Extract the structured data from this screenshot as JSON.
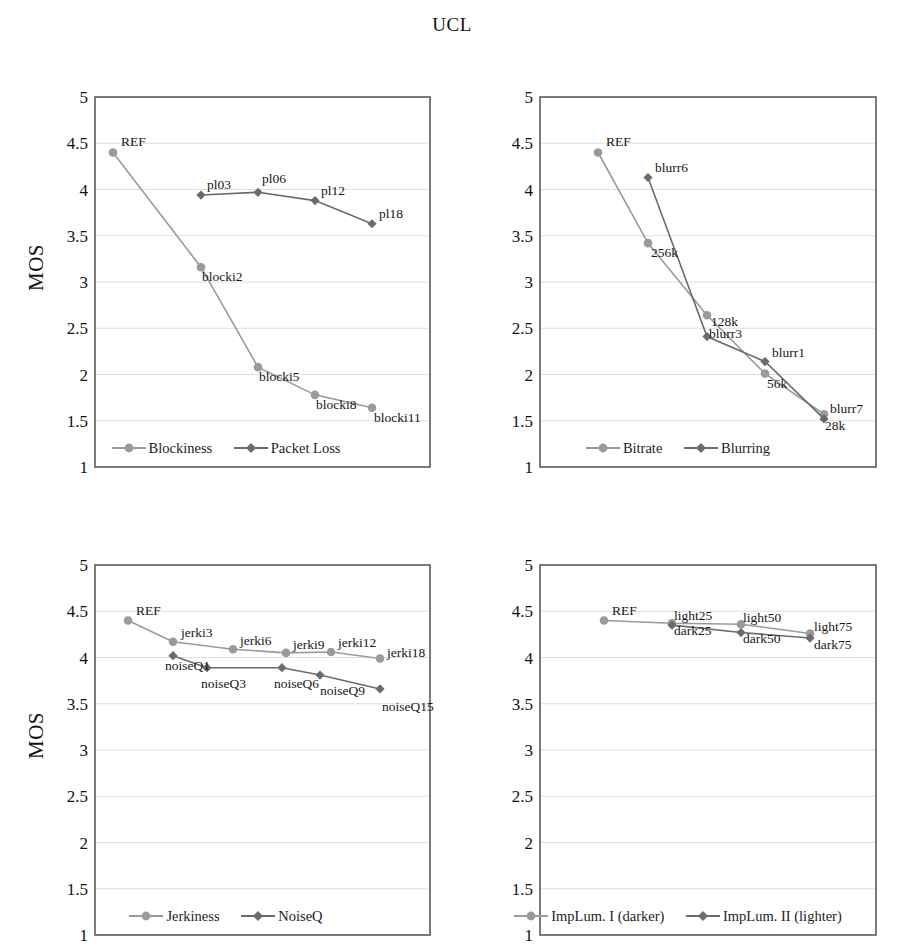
{
  "figure": {
    "title": "UCL",
    "y_axis_label": "MOS"
  },
  "style": {
    "series1_color": "#9a9a9a",
    "series2_color": "#6b6b6b",
    "plot_border_color": "#5a5a5a",
    "gridline_color": "#dedede",
    "text_color": "#171717"
  },
  "chart_data": [
    {
      "type": "line",
      "panel": "top-left",
      "title": "",
      "xlabel": "",
      "ylabel": "MOS",
      "ylim": [
        1,
        5
      ],
      "yticks": [
        "1",
        "1.5",
        "2",
        "2.5",
        "3",
        "3.5",
        "4",
        "4.5",
        "5"
      ],
      "grid": true,
      "legend_position": "bottom",
      "x": [
        0,
        1,
        2,
        3,
        4,
        5
      ],
      "series": [
        {
          "name": "Blockiness",
          "marker": "circle",
          "color": "#9a9a9a",
          "values": [
            4.4,
            3.16,
            2.08,
            1.78,
            1.64,
            null
          ],
          "point_labels": [
            "REF",
            "blocki2",
            "blocki5",
            "blocki8",
            "blocki11",
            ""
          ]
        },
        {
          "name": "Packet Loss",
          "marker": "diamond",
          "color": "#6b6b6b",
          "values": [
            4.4,
            3.94,
            3.97,
            3.88,
            3.63,
            null
          ],
          "point_labels": [
            "REF",
            "pl03",
            "pl06",
            "pl12",
            "pl18",
            ""
          ]
        }
      ]
    },
    {
      "type": "line",
      "panel": "top-right",
      "title": "",
      "xlabel": "",
      "ylabel": "MOS",
      "ylim": [
        1,
        5
      ],
      "yticks": [
        "1",
        "1.5",
        "2",
        "2.5",
        "3",
        "3.5",
        "4",
        "4.5",
        "5"
      ],
      "grid": true,
      "legend_position": "bottom",
      "x": [
        0,
        1,
        2,
        3,
        4
      ],
      "series": [
        {
          "name": "Bitrate",
          "marker": "circle",
          "color": "#9a9a9a",
          "values": [
            4.4,
            3.42,
            2.64,
            2.01,
            1.57
          ],
          "point_labels": [
            "REF",
            "256k",
            "128k",
            "56k",
            "28k"
          ]
        },
        {
          "name": "Blurring",
          "marker": "diamond",
          "color": "#6b6b6b",
          "values": [
            4.4,
            4.13,
            2.41,
            2.14,
            1.52
          ],
          "point_labels": [
            "REF",
            "blurr6",
            "blurr3",
            "blurr1",
            "blurr7"
          ]
        }
      ]
    },
    {
      "type": "line",
      "panel": "bottom-left",
      "title": "",
      "xlabel": "",
      "ylabel": "MOS",
      "ylim": [
        1,
        5
      ],
      "yticks": [
        "1",
        "1.5",
        "2",
        "2.5",
        "3",
        "3.5",
        "4",
        "4.5",
        "5"
      ],
      "grid": true,
      "legend_position": "bottom",
      "x": [
        0,
        1,
        2,
        3,
        4,
        5,
        6
      ],
      "series": [
        {
          "name": "Jerkiness",
          "marker": "circle",
          "color": "#9a9a9a",
          "values": [
            4.4,
            4.17,
            4.09,
            4.05,
            4.06,
            3.99,
            null
          ],
          "point_labels": [
            "REF",
            "jerki3",
            "jerki6",
            "jerki9",
            "jerki12",
            "jerki18",
            ""
          ]
        },
        {
          "name": "NoiseQ",
          "marker": "diamond",
          "color": "#6b6b6b",
          "values": [
            4.4,
            4.02,
            3.89,
            3.89,
            3.81,
            3.72,
            3.66
          ],
          "point_labels": [
            "REF",
            "noiseQ1",
            "noiseQ3",
            "noiseQ6",
            "noiseQ9",
            "noiseQ15",
            ""
          ]
        }
      ]
    },
    {
      "type": "line",
      "panel": "bottom-right",
      "title": "",
      "xlabel": "",
      "ylabel": "MOS",
      "ylim": [
        1,
        5
      ],
      "yticks": [
        "1",
        "1.5",
        "2",
        "2.5",
        "3",
        "3.5",
        "4",
        "4.5",
        "5"
      ],
      "grid": true,
      "legend_position": "bottom",
      "x": [
        0,
        1,
        2,
        3
      ],
      "series": [
        {
          "name": "ImpLum. I (darker)",
          "marker": "circle",
          "color": "#9a9a9a",
          "values": [
            4.4,
            4.37,
            4.36,
            4.26
          ],
          "point_labels": [
            "REF",
            "light25",
            "light50",
            "light75"
          ]
        },
        {
          "name": "ImpLum. II (lighter)",
          "marker": "diamond",
          "color": "#6b6b6b",
          "values": [
            4.4,
            4.35,
            4.27,
            4.21
          ],
          "point_labels": [
            "REF",
            "dark25",
            "dark50",
            "dark75"
          ]
        }
      ]
    }
  ],
  "panels": [
    {
      "key": "top-left",
      "points": [
        {
          "label": "REF",
          "x": 113,
          "y": 4.4,
          "lx": 8,
          "ly": -7,
          "series": 0
        },
        {
          "label": "blocki2",
          "x": 201,
          "y": 3.16,
          "lx": 1,
          "ly": 14,
          "series": 0
        },
        {
          "label": "blocki5",
          "x": 258,
          "y": 2.08,
          "lx": 1,
          "ly": 14,
          "series": 0
        },
        {
          "label": "blocki8",
          "x": 315,
          "y": 1.78,
          "lx": 1,
          "ly": 14,
          "series": 0
        },
        {
          "label": "blocki11",
          "x": 372,
          "y": 1.64,
          "lx": 2,
          "ly": 14,
          "series": 0
        },
        {
          "label": "pl03",
          "x": 201,
          "y": 3.94,
          "lx": 6,
          "ly": -6,
          "series": 1
        },
        {
          "label": "pl06",
          "x": 258,
          "y": 3.97,
          "lx": 4,
          "ly": -9,
          "series": 1
        },
        {
          "label": "pl12",
          "x": 315,
          "y": 3.88,
          "lx": 6,
          "ly": -6,
          "series": 1
        },
        {
          "label": "pl18",
          "x": 372,
          "y": 3.63,
          "lx": 7,
          "ly": -6,
          "series": 1
        }
      ]
    },
    {
      "key": "top-right",
      "points": [
        {
          "label": "REF",
          "x": 598,
          "y": 4.4,
          "lx": 8,
          "ly": -7,
          "series": 0
        },
        {
          "label": "256k",
          "x": 648,
          "y": 3.42,
          "lx": 3,
          "ly": 14,
          "series": 0
        },
        {
          "label": "128k",
          "x": 707,
          "y": 2.64,
          "lx": 4,
          "ly": 11,
          "series": 0
        },
        {
          "label": "56k",
          "x": 765,
          "y": 2.01,
          "lx": 2,
          "ly": 14,
          "series": 0
        },
        {
          "label": "28k",
          "x": 824,
          "y": 1.57,
          "lx": 1,
          "ly": 16,
          "series": 0
        },
        {
          "label": "blurr6",
          "x": 648,
          "y": 4.13,
          "lx": 7,
          "ly": -5,
          "series": 1
        },
        {
          "label": "blurr3",
          "x": 707,
          "y": 2.41,
          "lx": 2,
          "ly": 1,
          "series": 1
        },
        {
          "label": "blurr1",
          "x": 765,
          "y": 2.14,
          "lx": 7,
          "ly": -5,
          "series": 1
        },
        {
          "label": "blurr7",
          "x": 824,
          "y": 1.52,
          "lx": 6,
          "ly": -6,
          "series": 1
        }
      ]
    },
    {
      "key": "bottom-left",
      "points": [
        {
          "label": "REF",
          "x": 128,
          "y": 4.4,
          "lx": 8,
          "ly": -6,
          "series": 0
        },
        {
          "label": "jerki3",
          "x": 173,
          "y": 4.17,
          "lx": 8,
          "ly": -5,
          "series": 0
        },
        {
          "label": "jerki6",
          "x": 233,
          "y": 4.09,
          "lx": 7,
          "ly": -4,
          "series": 0
        },
        {
          "label": "jerki9",
          "x": 286,
          "y": 4.05,
          "lx": 7,
          "ly": -4,
          "series": 0
        },
        {
          "label": "jerki12",
          "x": 331,
          "y": 4.06,
          "lx": 7,
          "ly": -5,
          "series": 0
        },
        {
          "label": "jerki18",
          "x": 380,
          "y": 3.99,
          "lx": 7,
          "ly": -1,
          "series": 0
        },
        {
          "label": "noiseQ1",
          "x": 173,
          "y": 4.02,
          "lx": -8,
          "ly": 14,
          "series": 1
        },
        {
          "label": "noiseQ3",
          "x": 207,
          "y": 3.89,
          "lx": -6,
          "ly": 20,
          "series": 1
        },
        {
          "label": "noiseQ6",
          "x": 282,
          "y": 3.89,
          "lx": -8,
          "ly": 20,
          "series": 1
        },
        {
          "label": "noiseQ9",
          "x": 320,
          "y": 3.81,
          "lx": 0,
          "ly": 20,
          "series": 1
        },
        {
          "label": "noiseQ15",
          "x": 380,
          "y": 3.66,
          "lx": 2,
          "ly": 22,
          "series": 1
        }
      ]
    },
    {
      "key": "bottom-right",
      "points": [
        {
          "label": "REF",
          "x": 604,
          "y": 4.4,
          "lx": 8,
          "ly": -6,
          "series": 0
        },
        {
          "label": "light25",
          "x": 672,
          "y": 4.37,
          "lx": 2,
          "ly": -3,
          "series": 0
        },
        {
          "label": "light50",
          "x": 741,
          "y": 4.36,
          "lx": 2,
          "ly": -2,
          "series": 0
        },
        {
          "label": "light75",
          "x": 810,
          "y": 4.26,
          "lx": 4,
          "ly": -2,
          "series": 0
        },
        {
          "label": "dark25",
          "x": 672,
          "y": 4.35,
          "lx": 2,
          "ly": 10,
          "series": 1
        },
        {
          "label": "dark50",
          "x": 741,
          "y": 4.27,
          "lx": 2,
          "ly": 10,
          "series": 1
        },
        {
          "label": "dark75",
          "x": 810,
          "y": 4.21,
          "lx": 4,
          "ly": 11,
          "series": 1
        }
      ]
    }
  ]
}
